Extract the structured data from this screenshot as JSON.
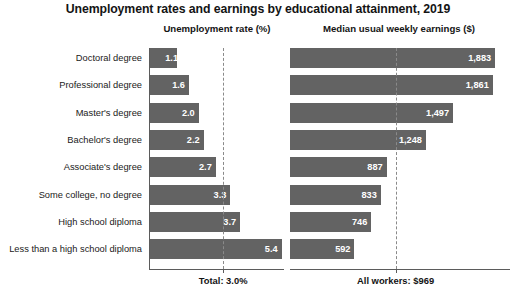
{
  "chart_data": {
    "type": "bar",
    "title": "Unemployment rates and earnings by educational attainment, 2019",
    "orientation": "horizontal",
    "grid": false,
    "legend": "none",
    "categories": [
      "Doctoral degree",
      "Professional degree",
      "Master's degree",
      "Bachelor's degree",
      "Associate's degree",
      "Some college, no degree",
      "High school diploma",
      "Less than a high school diploma"
    ],
    "panels": [
      {
        "name": "unemployment",
        "header": "Unemployment rate (%)",
        "xlabel": "",
        "ylabel": "",
        "xlim": [
          0,
          5.5
        ],
        "values": [
          1.1,
          1.6,
          2.0,
          2.2,
          2.7,
          3.3,
          3.7,
          5.4
        ],
        "value_labels": [
          "1.1",
          "1.6",
          "2.0",
          "2.2",
          "2.7",
          "3.3",
          "3.7",
          "5.4"
        ],
        "reference_line": {
          "value": 3.0,
          "style": "dashed",
          "label": "Total: 3.0%"
        }
      },
      {
        "name": "earnings",
        "header": "Median usual weekly earnings ($)",
        "xlabel": "",
        "ylabel": "",
        "xlim": [
          0,
          1900
        ],
        "values": [
          1883,
          1861,
          1497,
          1248,
          887,
          833,
          746,
          592
        ],
        "value_labels": [
          "1,883",
          "1,861",
          "1,497",
          "1,248",
          "887",
          "833",
          "746",
          "592"
        ],
        "reference_line": {
          "value": 969,
          "style": "dashed",
          "label": "All workers: $969"
        }
      }
    ],
    "colors": {
      "bar": "#636363",
      "bar_value_text": "#ffffff",
      "axis": "#5b5b5b",
      "reference_line": "#8a8a8a",
      "text": "#1a1a1a",
      "background": "#ffffff"
    }
  }
}
